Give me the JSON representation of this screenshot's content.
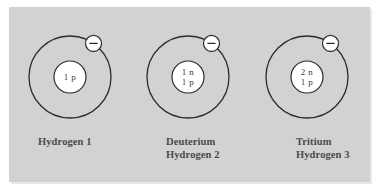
{
  "figure": {
    "background_color": "#d2d2d2",
    "page_color": "#ffffff",
    "line_color": "#2b2b2b",
    "nucleus_fill": "#ffffff",
    "label_color": "#4a4a4a"
  },
  "atoms": [
    {
      "id": "hydrogen-1",
      "label_lines": [
        "Hydrogen 1"
      ],
      "nucleus_lines": [
        "1 p"
      ],
      "protons": 1,
      "neutrons": 0,
      "electrons": 1,
      "electron_charge": "−",
      "center_x": 70,
      "center_y": 77,
      "orbit_radius": 41,
      "nucleus_radius": 16,
      "electron_angle_deg": -55,
      "electron_radius": 8
    },
    {
      "id": "deuterium-hydrogen-2",
      "label_lines": [
        "Deuterium",
        "Hydrogen 2"
      ],
      "nucleus_lines": [
        "1 n",
        "1 p"
      ],
      "protons": 1,
      "neutrons": 1,
      "electrons": 1,
      "electron_charge": "−",
      "center_x": 188,
      "center_y": 77,
      "orbit_radius": 41,
      "nucleus_radius": 16,
      "electron_angle_deg": -55,
      "electron_radius": 8
    },
    {
      "id": "tritium-hydrogen-3",
      "label_lines": [
        "Tritium",
        "Hydrogen 3"
      ],
      "nucleus_lines": [
        "2 n",
        "1 p"
      ],
      "protons": 1,
      "neutrons": 2,
      "electrons": 1,
      "electron_charge": "−",
      "center_x": 307,
      "center_y": 77,
      "orbit_radius": 41,
      "nucleus_radius": 16,
      "electron_angle_deg": -55,
      "electron_radius": 8
    }
  ]
}
